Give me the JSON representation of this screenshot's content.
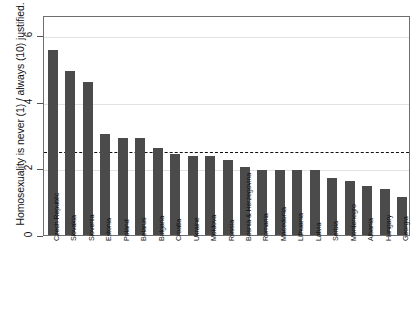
{
  "chart_data": {
    "type": "bar",
    "title": "",
    "xlabel": "",
    "ylabel": "Homosexuality is never (1) / always (10) justified.",
    "ylim": [
      0,
      6.6
    ],
    "yticks": [
      0,
      2,
      4,
      6
    ],
    "ytick_labels": [
      "0",
      "2",
      "4",
      "6"
    ],
    "grid": true,
    "gridlines_at": [
      2,
      4,
      6
    ],
    "legend": null,
    "reference_line": {
      "value": 2.56,
      "style": "dashed",
      "color": "#111111"
    },
    "bar_color": "#4b4b4b",
    "categories": [
      "Czech Republic",
      "Slovakia",
      "Slovenia",
      "Estonia",
      "Poland",
      "Belarus",
      "Bulgaria",
      "Croatia",
      "Ukraine",
      "Moldova",
      "Russia",
      "Bosnia & Herzegovina",
      "Romania",
      "Macedonia",
      "Lithuania",
      "Latvia",
      "Serbia",
      "Montenegro",
      "Albania",
      "Hungary",
      "Georgia"
    ],
    "values": [
      5.55,
      4.92,
      4.6,
      3.02,
      2.9,
      2.9,
      2.62,
      2.44,
      2.38,
      2.38,
      2.24,
      2.05,
      1.95,
      1.95,
      1.95,
      1.95,
      1.72,
      1.62,
      1.47,
      1.38,
      1.15
    ]
  }
}
